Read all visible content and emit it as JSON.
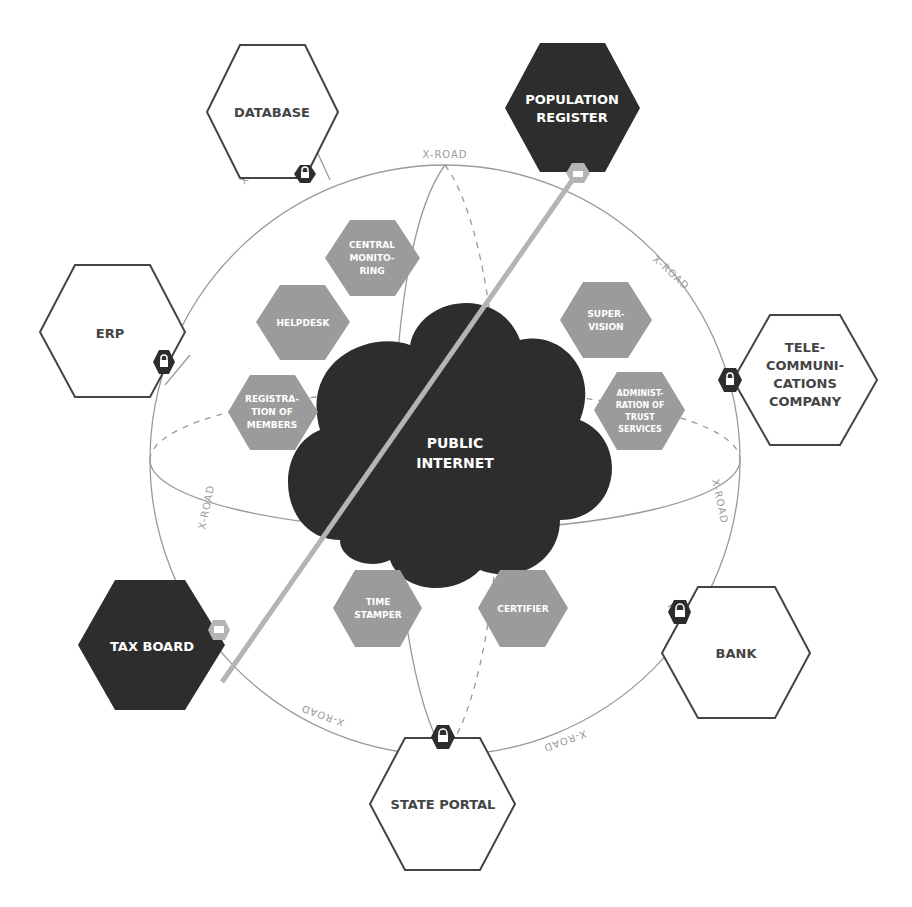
{
  "diagram": {
    "colors": {
      "dark_fill": "#2d2d2d",
      "grey_fill": "#9b9b9b",
      "light_grey": "#b4b4b4",
      "outline": "#444444",
      "road_text": "#9a9a9a",
      "background": "#ffffff"
    },
    "center": {
      "label_line1": "PUBLIC",
      "label_line2": "INTERNET"
    },
    "road_label": "X-ROAD",
    "outer_nodes": {
      "database": {
        "lines": [
          "DATABASE"
        ],
        "style": "outline"
      },
      "population_register": {
        "lines": [
          "POPULATION",
          "REGISTER"
        ],
        "style": "dark"
      },
      "erp": {
        "lines": [
          "ERP"
        ],
        "style": "outline"
      },
      "telecom": {
        "lines": [
          "TELE-",
          "COMMUNI-",
          "CATIONS",
          "COMPANY"
        ],
        "style": "outline"
      },
      "tax_board": {
        "lines": [
          "TAX BOARD"
        ],
        "style": "dark"
      },
      "bank": {
        "lines": [
          "BANK"
        ],
        "style": "outline"
      },
      "state_portal": {
        "lines": [
          "STATE PORTAL"
        ],
        "style": "outline"
      }
    },
    "inner_services": {
      "central_monitoring": {
        "lines": [
          "CENTRAL",
          "MONITO-",
          "RING"
        ]
      },
      "helpdesk": {
        "lines": [
          "HELPDESK"
        ]
      },
      "registration": {
        "lines": [
          "REGISTRA-",
          "TION OF",
          "MEMBERS"
        ]
      },
      "supervision": {
        "lines": [
          "SUPER-",
          "VISION"
        ]
      },
      "trust_admin": {
        "lines": [
          "ADMINIST-",
          "RATION OF",
          "TRUST",
          "SERVICES"
        ]
      },
      "time_stamper": {
        "lines": [
          "TIME",
          "STAMPER"
        ]
      },
      "certifier": {
        "lines": [
          "CERTIFIER"
        ]
      }
    }
  }
}
